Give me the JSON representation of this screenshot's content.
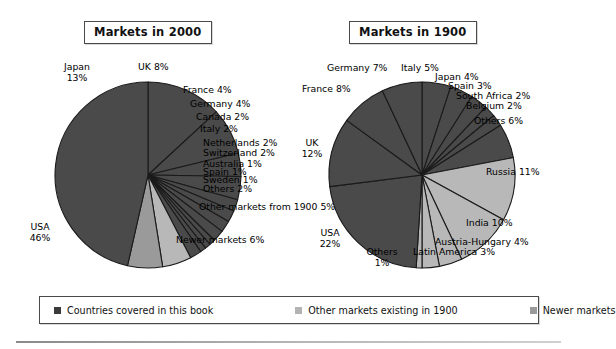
{
  "figure": {
    "charts": [
      {
        "id": "markets-2000",
        "title": "Markets in 2000",
        "labels": [
          {
            "name": "japan",
            "text": "Japan",
            "pct": "13%"
          },
          {
            "name": "uk",
            "text": "UK",
            "pct": "8%"
          },
          {
            "name": "france",
            "text": "France",
            "pct": "4%"
          },
          {
            "name": "germany",
            "text": "Germany",
            "pct": "4%"
          },
          {
            "name": "canada",
            "text": "Canada",
            "pct": "2%"
          },
          {
            "name": "italy",
            "text": "Italy",
            "pct": "2%"
          },
          {
            "name": "netherlands",
            "text": "Netherlands",
            "pct": "2%"
          },
          {
            "name": "switzerland",
            "text": "Switzerland",
            "pct": "2%"
          },
          {
            "name": "australia",
            "text": "Australia",
            "pct": "1%"
          },
          {
            "name": "spain",
            "text": "Spain",
            "pct": "1%"
          },
          {
            "name": "sweden",
            "text": "Sweden",
            "pct": "1%"
          },
          {
            "name": "others",
            "text": "Others",
            "pct": "2%"
          },
          {
            "name": "other-markets-from-1900",
            "text": "Other markets from 1900",
            "pct": "5%"
          },
          {
            "name": "newer-markets",
            "text": "Newer markets",
            "pct": "6%"
          },
          {
            "name": "usa",
            "text": "USA",
            "pct": "46%"
          }
        ]
      },
      {
        "id": "markets-1900",
        "title": "Markets in 1900",
        "labels": [
          {
            "name": "germany",
            "text": "Germany",
            "pct": "7%"
          },
          {
            "name": "italy",
            "text": "Italy",
            "pct": "5%"
          },
          {
            "name": "japan",
            "text": "Japan",
            "pct": "4%"
          },
          {
            "name": "spain",
            "text": "Spain",
            "pct": "3%"
          },
          {
            "name": "south-africa",
            "text": "South Africa",
            "pct": "2%"
          },
          {
            "name": "belgium",
            "text": "Belgium",
            "pct": "2%"
          },
          {
            "name": "others-top",
            "text": "Others",
            "pct": "6%"
          },
          {
            "name": "france",
            "text": "France",
            "pct": "8%"
          },
          {
            "name": "uk",
            "text": "UK",
            "pct": "12%"
          },
          {
            "name": "usa",
            "text": "USA",
            "pct": "22%"
          },
          {
            "name": "russia",
            "text": "Russia",
            "pct": "11%"
          },
          {
            "name": "india",
            "text": "India",
            "pct": "10%"
          },
          {
            "name": "austria-hungary",
            "text": "Austria-Hungary",
            "pct": "4%"
          },
          {
            "name": "latin-america",
            "text": "Latin America",
            "pct": "3%"
          },
          {
            "name": "others-bottom",
            "text": "Others",
            "pct": "1%"
          }
        ]
      }
    ],
    "legend": {
      "items": [
        {
          "name": "countries-covered",
          "label": "Countries covered in this book",
          "color": "#3a3a3a"
        },
        {
          "name": "other-markets-1900",
          "label": "Other markets existing in 1900",
          "color": "#b3b3b3"
        },
        {
          "name": "newer-markets",
          "label": "Newer markets",
          "color": "#9a9a9a"
        }
      ]
    },
    "colors": {
      "dark": "#4a4a4a",
      "mid": "#9a9a9a",
      "light": "#b8b8b8",
      "outline": "#1a1a1a",
      "background": "#ffffff"
    }
  },
  "chart_data": [
    {
      "type": "pie",
      "title": "Markets in 2000",
      "units": "percent",
      "legend_position": "bottom",
      "categories": [
        "Japan",
        "UK",
        "France",
        "Germany",
        "Canada",
        "Italy",
        "Netherlands",
        "Switzerland",
        "Australia",
        "Spain",
        "Sweden",
        "Others",
        "Other markets from 1900",
        "Newer markets",
        "USA"
      ],
      "values": [
        13,
        8,
        4,
        4,
        2,
        2,
        2,
        2,
        1,
        1,
        1,
        2,
        5,
        6,
        46
      ],
      "groups": [
        "Countries covered in this book",
        "Countries covered in this book",
        "Countries covered in this book",
        "Countries covered in this book",
        "Countries covered in this book",
        "Countries covered in this book",
        "Countries covered in this book",
        "Countries covered in this book",
        "Countries covered in this book",
        "Countries covered in this book",
        "Countries covered in this book",
        "Countries covered in this book",
        "Other markets existing in 1900",
        "Newer markets",
        "Countries covered in this book"
      ],
      "total": 99
    },
    {
      "type": "pie",
      "title": "Markets in 1900",
      "units": "percent",
      "legend_position": "bottom",
      "categories": [
        "Italy",
        "Japan",
        "Spain",
        "South Africa",
        "Belgium",
        "Others",
        "Russia",
        "India",
        "Austria-Hungary",
        "Latin America",
        "Others",
        "USA",
        "UK",
        "France",
        "Germany"
      ],
      "values": [
        5,
        4,
        3,
        2,
        2,
        6,
        11,
        10,
        4,
        3,
        1,
        22,
        12,
        8,
        7
      ],
      "groups": [
        "Countries covered in this book",
        "Countries covered in this book",
        "Countries covered in this book",
        "Countries covered in this book",
        "Countries covered in this book",
        "Countries covered in this book",
        "Other markets existing in 1900",
        "Other markets existing in 1900",
        "Other markets existing in 1900",
        "Other markets existing in 1900",
        "Other markets existing in 1900",
        "Countries covered in this book",
        "Countries covered in this book",
        "Countries covered in this book",
        "Countries covered in this book"
      ],
      "total": 100
    }
  ]
}
